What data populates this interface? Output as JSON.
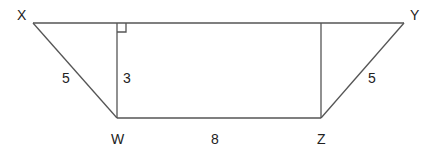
{
  "diagram": {
    "type": "trapezoid",
    "stroke_color": "#555555",
    "vertices": {
      "X": {
        "label": "X",
        "x": 33,
        "y": 23
      },
      "Y": {
        "label": "Y",
        "x": 404,
        "y": 23
      },
      "W": {
        "label": "W",
        "x": 117,
        "y": 118
      },
      "Z": {
        "label": "Z",
        "x": 321,
        "y": 118
      }
    },
    "edge_labels": {
      "XW": "5",
      "height": "3",
      "WZ": "8",
      "ZY": "5"
    },
    "right_angle_marker": {
      "at": "foot of altitude from W on XY"
    }
  }
}
